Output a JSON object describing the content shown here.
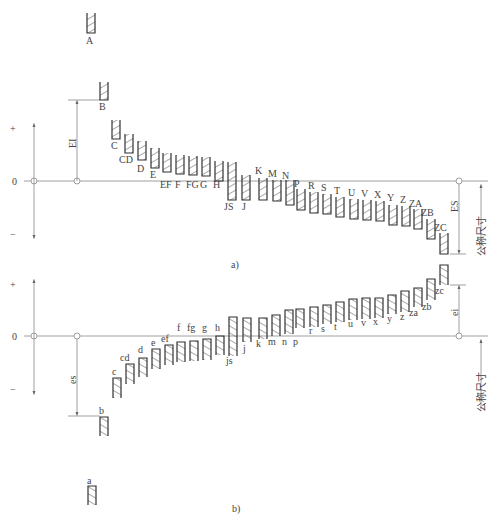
{
  "figure": {
    "part_a_caption": "a)",
    "part_b_caption": "b)",
    "colors": {
      "line": "#333333",
      "axis": "#888888",
      "text": "#444444",
      "hatch": "#555555"
    }
  },
  "part_a": {
    "title": "Fundamental deviations of holes",
    "axis": {
      "plus": "+",
      "zero": "0",
      "minus": "−"
    },
    "dim_EI": "EI",
    "dim_ES": "ES",
    "nominal_size": "公称尺寸",
    "zero_line_y": 181,
    "bands": [
      {
        "label": "A",
        "x": 87,
        "top": 13,
        "bottom": 33,
        "lx": 89,
        "ly": 44
      },
      {
        "label": "B",
        "x": 100,
        "top": 82,
        "bottom": 100,
        "lx": 102,
        "ly": 110
      },
      {
        "label": "C",
        "x": 112,
        "top": 120,
        "bottom": 139,
        "lx": 114,
        "ly": 149
      },
      {
        "label": "CD",
        "x": 125,
        "top": 134,
        "bottom": 153,
        "lx": 122,
        "ly": 163
      },
      {
        "label": "D",
        "x": 138,
        "top": 141,
        "bottom": 160,
        "lx": 140,
        "ly": 172
      },
      {
        "label": "E",
        "x": 151,
        "top": 148,
        "bottom": 168,
        "lx": 153,
        "ly": 178
      },
      {
        "label": "EF",
        "x": 163,
        "top": 153,
        "bottom": 172,
        "lx": 163,
        "ly": 188
      },
      {
        "label": "F",
        "x": 176,
        "top": 155,
        "bottom": 174,
        "lx": 178,
        "ly": 188
      },
      {
        "label": "FG",
        "x": 189,
        "top": 156,
        "bottom": 175,
        "lx": 189,
        "ly": 188
      },
      {
        "label": "G",
        "x": 202,
        "top": 157,
        "bottom": 176,
        "lx": 203,
        "ly": 188
      },
      {
        "label": "H",
        "x": 215,
        "top": 161,
        "bottom": 181,
        "lx": 216,
        "ly": 188
      },
      {
        "label": "JS",
        "x": 228,
        "top": 162,
        "bottom": 200,
        "lx": 227,
        "ly": 210
      },
      {
        "label": "J",
        "x": 242,
        "top": 175,
        "bottom": 200,
        "lx": 245,
        "ly": 210
      },
      {
        "label": "K",
        "x": 259,
        "top": 178,
        "bottom": 200,
        "lx": 258,
        "ly": 174
      },
      {
        "label": "M",
        "x": 273,
        "top": 180,
        "bottom": 201,
        "lx": 271,
        "ly": 177
      },
      {
        "label": "N",
        "x": 286,
        "top": 180,
        "bottom": 205,
        "lx": 285,
        "ly": 179
      },
      {
        "label": "P",
        "x": 297,
        "top": 189,
        "bottom": 210,
        "lx": 297,
        "ly": 187
      },
      {
        "label": "R",
        "x": 310,
        "top": 192,
        "bottom": 213,
        "lx": 311,
        "ly": 189
      },
      {
        "label": "S",
        "x": 323,
        "top": 194,
        "bottom": 214,
        "lx": 324,
        "ly": 191
      },
      {
        "label": "T",
        "x": 336,
        "top": 197,
        "bottom": 217,
        "lx": 337,
        "ly": 194
      },
      {
        "label": "U",
        "x": 350,
        "top": 199,
        "bottom": 219,
        "lx": 351,
        "ly": 196
      },
      {
        "label": "V",
        "x": 363,
        "top": 200,
        "bottom": 220,
        "lx": 364,
        "ly": 197
      },
      {
        "label": "X",
        "x": 376,
        "top": 201,
        "bottom": 221,
        "lx": 377,
        "ly": 198
      },
      {
        "label": "Y",
        "x": 389,
        "top": 205,
        "bottom": 225,
        "lx": 390,
        "ly": 201
      },
      {
        "label": "Z",
        "x": 402,
        "top": 206,
        "bottom": 226,
        "lx": 403,
        "ly": 203
      },
      {
        "label": "ZA",
        "x": 414,
        "top": 209,
        "bottom": 229,
        "lx": 412,
        "ly": 207
      },
      {
        "label": "ZB",
        "x": 427,
        "top": 219,
        "bottom": 239,
        "lx": 424,
        "ly": 216
      },
      {
        "label": "ZC",
        "x": 440,
        "top": 233,
        "bottom": 254,
        "lx": 437,
        "ly": 231
      }
    ]
  },
  "part_b": {
    "title": "Fundamental deviations of shafts",
    "axis": {
      "plus": "+",
      "zero": "0",
      "minus": "−"
    },
    "dim_es": "es",
    "dim_ei": "ei",
    "nominal_size": "公称尺寸",
    "zero_line_y": 336,
    "bands": [
      {
        "label": "a",
        "x": 88,
        "top": 486,
        "bottom": 505,
        "lx": 90,
        "ly": 484
      },
      {
        "label": "b",
        "x": 100,
        "top": 417,
        "bottom": 436,
        "lx": 102,
        "ly": 414
      },
      {
        "label": "c",
        "x": 113,
        "top": 378,
        "bottom": 398,
        "lx": 115,
        "ly": 375
      },
      {
        "label": "cd",
        "x": 126,
        "top": 364,
        "bottom": 384,
        "lx": 123,
        "ly": 361
      },
      {
        "label": "d",
        "x": 139,
        "top": 358,
        "bottom": 377,
        "lx": 141,
        "ly": 353
      },
      {
        "label": "e",
        "x": 152,
        "top": 349,
        "bottom": 369,
        "lx": 154,
        "ly": 346
      },
      {
        "label": "ef",
        "x": 165,
        "top": 345,
        "bottom": 365,
        "lx": 164,
        "ly": 342
      },
      {
        "label": "f",
        "x": 177,
        "top": 342,
        "bottom": 362,
        "lx": 180,
        "ly": 331
      },
      {
        "label": "fg",
        "x": 190,
        "top": 341,
        "bottom": 361,
        "lx": 190,
        "ly": 331
      },
      {
        "label": "g",
        "x": 203,
        "top": 339,
        "bottom": 360,
        "lx": 205,
        "ly": 331
      },
      {
        "label": "h",
        "x": 216,
        "top": 336,
        "bottom": 355,
        "lx": 218,
        "ly": 331
      },
      {
        "label": "js",
        "x": 229,
        "top": 317,
        "bottom": 356,
        "lx": 229,
        "ly": 364
      },
      {
        "label": "j",
        "x": 243,
        "top": 318,
        "bottom": 342,
        "lx": 246,
        "ly": 352
      },
      {
        "label": "k",
        "x": 259,
        "top": 318,
        "bottom": 339,
        "lx": 259,
        "ly": 347
      },
      {
        "label": "m",
        "x": 272,
        "top": 315,
        "bottom": 336,
        "lx": 271,
        "ly": 345
      },
      {
        "label": "n",
        "x": 285,
        "top": 310,
        "bottom": 334,
        "lx": 285,
        "ly": 345
      },
      {
        "label": "p",
        "x": 296,
        "top": 309,
        "bottom": 328,
        "lx": 296,
        "ly": 345
      },
      {
        "label": "r",
        "x": 310,
        "top": 307,
        "bottom": 327,
        "lx": 312,
        "ly": 334
      },
      {
        "label": "s",
        "x": 323,
        "top": 305,
        "bottom": 324,
        "lx": 324,
        "ly": 332
      },
      {
        "label": "t",
        "x": 336,
        "top": 302,
        "bottom": 322,
        "lx": 337,
        "ly": 330
      },
      {
        "label": "u",
        "x": 349,
        "top": 299,
        "bottom": 320,
        "lx": 351,
        "ly": 327
      },
      {
        "label": "v",
        "x": 362,
        "top": 298,
        "bottom": 319,
        "lx": 364,
        "ly": 326
      },
      {
        "label": "x",
        "x": 375,
        "top": 298,
        "bottom": 318,
        "lx": 376,
        "ly": 325
      },
      {
        "label": "y",
        "x": 388,
        "top": 295,
        "bottom": 314,
        "lx": 390,
        "ly": 322
      },
      {
        "label": "z",
        "x": 401,
        "top": 291,
        "bottom": 312,
        "lx": 403,
        "ly": 320
      },
      {
        "label": "za",
        "x": 414,
        "top": 288,
        "bottom": 307,
        "lx": 412,
        "ly": 316
      },
      {
        "label": "zb",
        "x": 427,
        "top": 279,
        "bottom": 300,
        "lx": 425,
        "ly": 310
      },
      {
        "label": "zc",
        "x": 440,
        "top": 265,
        "bottom": 285,
        "lx": 438,
        "ly": 294
      }
    ]
  }
}
